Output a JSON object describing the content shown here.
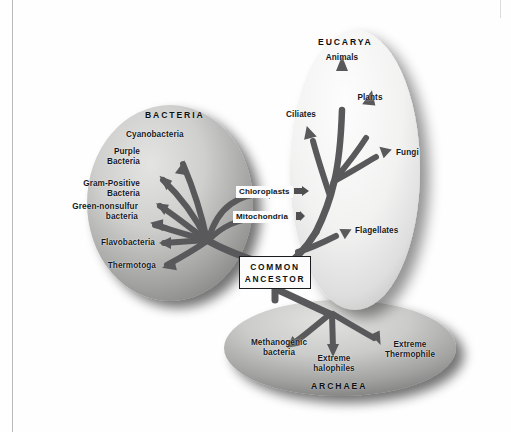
{
  "figure": {
    "domains": [
      {
        "name": "bacteria",
        "label": "BACTERIA"
      },
      {
        "name": "eucarya",
        "label": "EUCARYA"
      },
      {
        "name": "archaea",
        "label": "ARCHAEA"
      }
    ],
    "root": {
      "line1": "COMMON",
      "line2": "ANCESTOR"
    },
    "organelles": [
      {
        "name": "chloroplasts",
        "label": "Chloroplasts"
      },
      {
        "name": "mitochondria",
        "label": "Mitochondria"
      }
    ],
    "bacteria_taxa": [
      {
        "name": "cyanobacteria",
        "label": "Cyanobacteria"
      },
      {
        "name": "purple-bacteria",
        "label": "Purple",
        "label2": "Bacteria"
      },
      {
        "name": "gram-positive",
        "label": "Gram-Positive",
        "label2": "Bacteria"
      },
      {
        "name": "green-nonsulfur",
        "label": "Green-nonsulfur",
        "label2": "bacteria"
      },
      {
        "name": "flavobacteria",
        "label": "Flavobacteria"
      },
      {
        "name": "thermotoga",
        "label": "Thermotoga"
      }
    ],
    "eucarya_taxa": [
      {
        "name": "animals",
        "label": "Animals"
      },
      {
        "name": "plants",
        "label": "Plants"
      },
      {
        "name": "fungi",
        "label": "Fungi"
      },
      {
        "name": "ciliates",
        "label": "Ciliates"
      },
      {
        "name": "flagellates",
        "label": "Flagellates"
      }
    ],
    "archaea_taxa": [
      {
        "name": "methanogenic-bacteria",
        "label": "Methanogenic",
        "label2": "bacteria"
      },
      {
        "name": "extreme-halophiles",
        "label": "Extreme",
        "label2": "halophiles"
      },
      {
        "name": "extreme-thermophile",
        "label": "Extreme",
        "label2": "Thermophile"
      }
    ],
    "colors": {
      "branch": "#59595b",
      "text": "#14181c",
      "bacteria_ellipse_light": "#d8d8d6",
      "bacteria_ellipse_dark": "#8d8d8b",
      "eucarya_ellipse_light": "#fafafa",
      "eucarya_ellipse_dark": "#c9c9c7",
      "archaea_ellipse_light": "#d5d5d3",
      "archaea_ellipse_dark": "#8a8a88",
      "page": "#fefefe"
    }
  }
}
